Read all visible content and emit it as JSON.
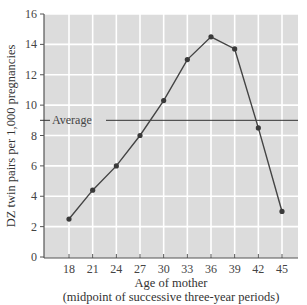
{
  "chart_data": {
    "type": "line",
    "title": "",
    "xlabel": "Age of mother",
    "xlabel_sub": "(midpoint of successive three-year periods)",
    "ylabel": "DZ twin pairs per 1,000 pregnancies",
    "x": [
      18,
      21,
      24,
      27,
      30,
      33,
      36,
      39,
      42,
      45
    ],
    "categories": [
      "18",
      "21",
      "24",
      "27",
      "30",
      "33",
      "36",
      "39",
      "42",
      "45"
    ],
    "series": [
      {
        "name": "DZ twin rate",
        "values": [
          2.5,
          4.4,
          6.0,
          8.0,
          10.3,
          13.0,
          14.5,
          13.7,
          8.5,
          3.0
        ]
      }
    ],
    "annotations": [
      {
        "type": "hline",
        "y": 9.0,
        "label": "Average"
      }
    ],
    "yticks": [
      0,
      2,
      4,
      6,
      8,
      10,
      12,
      14,
      16
    ],
    "ylim": [
      0,
      16
    ],
    "xlim": [
      15,
      47
    ],
    "grid": true,
    "legend": "none",
    "colors": {
      "plot_bg": "#dcdcdc",
      "grid": "#ffffff",
      "line": "#444444",
      "marker": "#3a3a3a",
      "average": "#333333"
    }
  }
}
